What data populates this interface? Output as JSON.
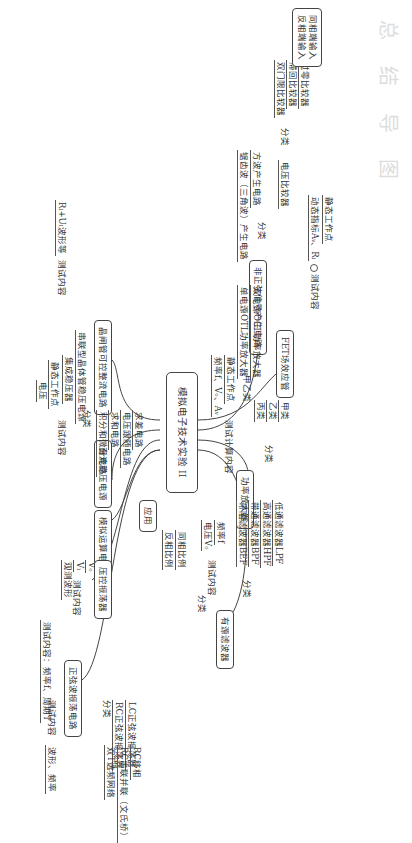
{
  "watermark_title": "总 结 导 图",
  "root": "模拟电子技术实验 II",
  "branches": {
    "fet": {
      "label": "FET场效应管",
      "test": "测试内容",
      "items": [
        "静态工作点",
        "动态指标Aᵥ、Rᵢ"
      ]
    },
    "nonsine": {
      "label": "非正弦信号产生电路",
      "classify": "分类",
      "comparator": "电压比较器",
      "comparator_classify": "分类",
      "comparator_types": [
        "过零比较器",
        "滞回比较器",
        "双门限比较器"
      ],
      "inputs": [
        "同相端输入",
        "反相端输入"
      ],
      "square": "方波产生电路",
      "sawtooth": "锯齿波（三角波）产生电路"
    },
    "power": {
      "label": "功率放大器",
      "classify": "分类",
      "classes": [
        "甲类",
        "乙类",
        "丙类"
      ],
      "ab": "甲乙类",
      "ab_types": [
        "双电源OCL功率放大器",
        "单电源OTL功率放大器"
      ],
      "test": "测试计算内容",
      "test_items": [
        "静态工作点",
        "频率f、Vₒ、Aᵥ"
      ]
    },
    "filter": {
      "label": "有源滤波器",
      "classify": "分类",
      "types": [
        "低通滤波器LPF",
        "高通滤波器HPF",
        "带通滤波器BPF",
        "带阻滤波器BEF"
      ],
      "test": "测试内容",
      "test_items": [
        "频率f",
        "电压Vₒ"
      ]
    },
    "scr": {
      "label": "晶闸管可控整流电路",
      "test": "测试内容",
      "item": "Rₗ+Uₗ波形等"
    },
    "dc": {
      "label": "直流稳压电源",
      "classify": "分类",
      "types": [
        "串联型晶体管稳压电源",
        "集成稳压器"
      ],
      "test": "测试内容",
      "test_items": [
        "静态工作点",
        "电压"
      ]
    },
    "opamp": {
      "label": "模拟运算电路",
      "classify": "分类",
      "types": [
        "同相比例",
        "反相比例"
      ],
      "apply": "应用",
      "apps": [
        "求差电路",
        "电压跟随电路",
        "求和电路",
        "积分和微分电路"
      ],
      "test": "测试内容",
      "test_items": [
        "Vₒ",
        "Vᵢ",
        "观测波形"
      ]
    },
    "vco": {
      "label": "压控振荡器",
      "item": "测试内容：频率f、周期T"
    },
    "sine": {
      "label": "正弦波振荡电路",
      "classify": "分类",
      "lc": "LC正弦波振荡器",
      "rc": "RC正弦波振荡器",
      "rc_types": [
        "RC移相",
        "RC串联并联（文氏桥）",
        "双T选频网络"
      ],
      "test": "测试内容",
      "test_item": "波形、频率"
    }
  }
}
